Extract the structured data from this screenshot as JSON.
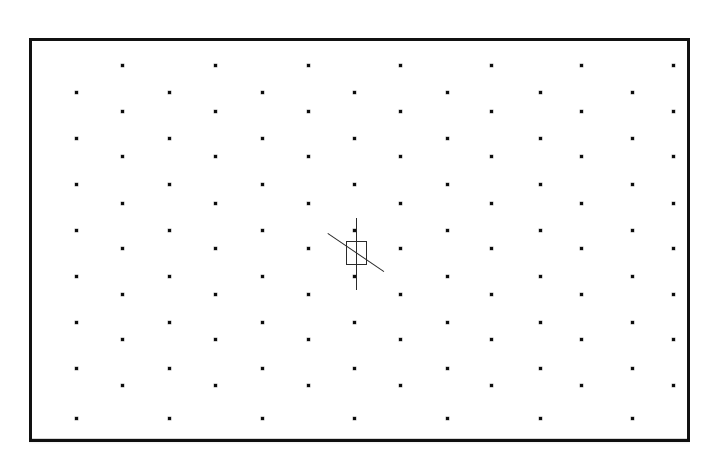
{
  "canvas": {
    "title": "Dot Grid Canvas",
    "background_color": "#ffffff",
    "width": 717,
    "height": 461
  },
  "frame": {
    "name": "drawing-frame",
    "left": 29,
    "top": 38,
    "width": 661,
    "height": 404,
    "border_width": 3,
    "border_color": "#111111"
  },
  "grid": {
    "description": "Staggered (offset) dot grid",
    "dot_color": "#0d0d0d",
    "dot_size": 3,
    "column_spacing": 92.5,
    "row_spacing": 45.5,
    "odd_row_x": [
      90,
      183,
      276,
      368,
      459,
      549,
      641
    ],
    "even_row_x": [
      44,
      137,
      230,
      322,
      415,
      508,
      600
    ],
    "odd_row_y": [
      24,
      115,
      207,
      298
    ],
    "even_row_y": [
      51,
      97,
      143,
      189,
      235,
      281,
      327,
      377
    ],
    "rows": [
      {
        "index": 1,
        "parity": "odd",
        "y": 24,
        "x": [
          90,
          183,
          276,
          368,
          459,
          549,
          641
        ]
      },
      {
        "index": 2,
        "parity": "even",
        "y": 51,
        "x": [
          44,
          137,
          230,
          322,
          415,
          508,
          600
        ]
      },
      {
        "index": 3,
        "parity": "odd",
        "y": 70,
        "x": [
          90,
          183,
          276,
          368,
          459,
          549,
          641
        ]
      },
      {
        "index": 4,
        "parity": "even",
        "y": 97,
        "x": [
          44,
          137,
          230,
          322,
          415,
          508,
          600
        ]
      },
      {
        "index": 5,
        "parity": "odd",
        "y": 115,
        "x": [
          90,
          183,
          276,
          368,
          459,
          549,
          641
        ]
      },
      {
        "index": 6,
        "parity": "even",
        "y": 143,
        "x": [
          44,
          137,
          230,
          322,
          415,
          508,
          600
        ]
      },
      {
        "index": 7,
        "parity": "odd",
        "y": 162,
        "x": [
          90,
          183,
          276,
          368,
          459,
          549,
          641
        ]
      },
      {
        "index": 8,
        "parity": "even",
        "y": 189,
        "x": [
          44,
          137,
          230,
          322,
          415,
          508,
          600
        ]
      },
      {
        "index": 9,
        "parity": "odd",
        "y": 207,
        "x": [
          90,
          183,
          276,
          368,
          459,
          549,
          641
        ]
      },
      {
        "index": 10,
        "parity": "even",
        "y": 235,
        "x": [
          44,
          137,
          230,
          322,
          415,
          508,
          600
        ]
      },
      {
        "index": 11,
        "parity": "odd",
        "y": 253,
        "x": [
          90,
          183,
          276,
          368,
          459,
          549,
          641
        ]
      },
      {
        "index": 12,
        "parity": "even",
        "y": 281,
        "x": [
          44,
          137,
          230,
          322,
          415,
          508,
          600
        ]
      },
      {
        "index": 13,
        "parity": "odd",
        "y": 298,
        "x": [
          90,
          183,
          276,
          368,
          459,
          549,
          641
        ]
      },
      {
        "index": 14,
        "parity": "even",
        "y": 327,
        "x": [
          44,
          137,
          230,
          322,
          415,
          508,
          600
        ]
      },
      {
        "index": 15,
        "parity": "odd",
        "y": 344,
        "x": [
          90,
          183,
          276,
          368,
          459,
          549,
          641
        ]
      },
      {
        "index": 16,
        "parity": "even",
        "y": 377,
        "x": [
          44,
          137,
          230,
          322,
          415,
          508,
          600
        ]
      }
    ]
  },
  "cursor": {
    "name": "crosshair-cursor",
    "center_x": 324,
    "center_y": 212,
    "vertical_line": {
      "x": 324,
      "y_top": 177,
      "length": 72,
      "color": "#2a2a2a"
    },
    "diagonal_line": {
      "x1": 296,
      "y1": 192,
      "x2": 352,
      "y2": 230,
      "color": "#2a2a2a"
    },
    "box": {
      "left": 314,
      "top": 200,
      "width": 21,
      "height": 24,
      "color": "#2a2a2a"
    }
  }
}
